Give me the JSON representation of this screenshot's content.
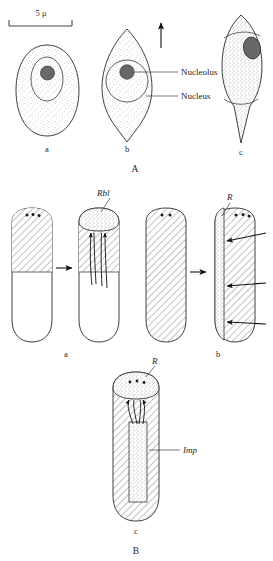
{
  "figure": {
    "scale_bar": {
      "label": "5 μ"
    },
    "panels": [
      {
        "id": "A",
        "label": "A",
        "cells": [
          {
            "id": "a",
            "label": "a",
            "shape": "oval",
            "has_nucleus": true,
            "has_nucleolus": true
          },
          {
            "id": "b",
            "label": "b",
            "shape": "spindle-pointed",
            "has_nucleus": true,
            "has_nucleolus": true
          },
          {
            "id": "c",
            "label": "c",
            "shape": "elongate-tailed",
            "has_nucleus": false,
            "has_nucleolus": true
          }
        ],
        "callouts": [
          {
            "name": "nucleolus",
            "text": "Nucleolus"
          },
          {
            "name": "nucleus",
            "text": "Nucleus"
          }
        ],
        "direction_arrow": {
          "name": "elongation-arrow",
          "orientation": "up"
        }
      },
      {
        "id": "B",
        "label": "B",
        "rows": [
          {
            "id": "a",
            "label": "a",
            "callouts": [
              {
                "name": "rbl",
                "text": "Rbl"
              }
            ],
            "transition_arrow": "right"
          },
          {
            "id": "b",
            "label": "b",
            "callouts": [
              {
                "name": "r",
                "text": "R"
              }
            ],
            "transition_arrow": "right",
            "inward_arrow_count": 3
          },
          {
            "id": "c",
            "label": "c",
            "callouts": [
              {
                "name": "r",
                "text": "R"
              },
              {
                "name": "imp",
                "text": "Imp"
              }
            ]
          }
        ]
      }
    ]
  },
  "colors": {
    "ink": "#1d1d1d",
    "outline": "#2b2b2b",
    "stipple": "#8a8a8a",
    "hatch": "#555555",
    "nucleolus_fill": "#6b6b6b",
    "background": "#ffffff"
  }
}
